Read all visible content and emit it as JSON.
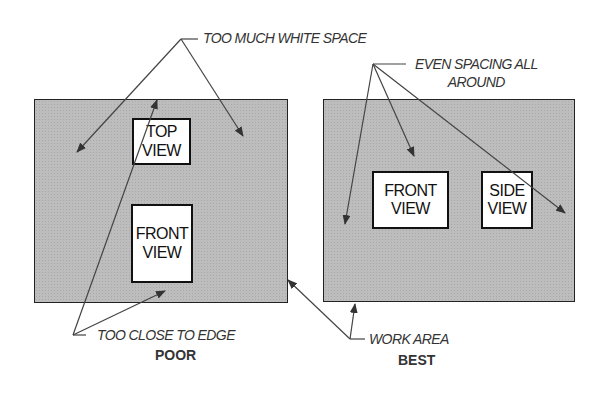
{
  "diagram": {
    "colors": {
      "work_area": "#bdbdbd",
      "border": "#222222",
      "leader": "#444444"
    }
  },
  "poor": {
    "caption": "POOR",
    "views": [
      {
        "line1": "TOP",
        "line2": "VIEW"
      },
      {
        "line1": "FRONT",
        "line2": "VIEW"
      }
    ],
    "callout_top": "TOO MUCH WHITE SPACE",
    "callout_bottom": "TOO CLOSE TO EDGE"
  },
  "best": {
    "caption": "BEST",
    "views": [
      {
        "line1": "FRONT",
        "line2": "VIEW"
      },
      {
        "line1": "SIDE",
        "line2": "VIEW"
      }
    ],
    "callout_top_line1": "EVEN SPACING ALL",
    "callout_top_line2": "AROUND",
    "callout_bottom": "WORK AREA"
  }
}
